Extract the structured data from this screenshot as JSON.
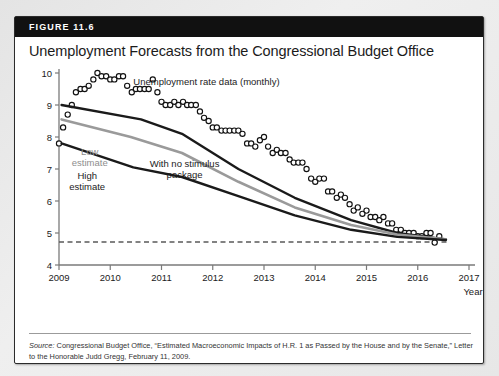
{
  "figure": {
    "number_label": "FIGURE 11.6",
    "title": "Unemployment Forecasts from the Congressional Budget Office",
    "source_label": "Source:",
    "source_text": " Congressional Budget Office, “Estimated Macroeconomic Impacts of H.R. 1 as Passed by the House and by the Senate,” Letter to the Honorable Judd Gregg, February 11, 2009."
  },
  "colors": {
    "header_bar": "#111111",
    "card_border": "#2b2b2b",
    "axis": "#7a7a7a",
    "no_stimulus_line": "#1a1a1a",
    "low_estimate_line": "#9a9a9a",
    "high_estimate_line": "#1a1a1a",
    "marker_stroke": "#111111",
    "dashed_line": "#5a5a5a",
    "text": "#1b1b1b"
  },
  "chart_data": {
    "type": "line",
    "title": "Unemployment Forecasts from the Congressional Budget Office",
    "xlabel": "Year",
    "ylabel": "Percent",
    "xlim": [
      2009,
      2017
    ],
    "ylim": [
      4,
      10
    ],
    "xticks": [
      "2009",
      "2010",
      "2011",
      "2012",
      "2013",
      "2014",
      "2015",
      "2016",
      "2017"
    ],
    "yticks": [
      "4",
      "5",
      "6",
      "7",
      "8",
      "9",
      "10"
    ],
    "grid": false,
    "legend": "inline-annotations",
    "annotations": [
      {
        "name": "unemployment-rate-data",
        "text": "Unemployment rate data (monthly)",
        "x": 2010.45,
        "y": 9.62
      },
      {
        "name": "low-estimate",
        "text": "Low\nestimate",
        "x": 2009.6,
        "y": 7.45
      },
      {
        "name": "high-estimate",
        "text": "High\nestimate",
        "x": 2009.55,
        "y": 6.7
      },
      {
        "name": "with-no-stimulus-package",
        "text": "With no stimulus\npackage",
        "x": 2011.45,
        "y": 7.05
      }
    ],
    "reference_line": {
      "name": "natural-rate-dashed",
      "y": 4.72,
      "x_start": 2009.0,
      "x_end": 2016.6,
      "style": "dashed"
    },
    "series": [
      {
        "name": "Unemployment rate data (monthly)",
        "type": "scatter",
        "marker": "open-circle",
        "x": [
          2009.0,
          2009.08,
          2009.17,
          2009.25,
          2009.33,
          2009.42,
          2009.5,
          2009.58,
          2009.67,
          2009.75,
          2009.83,
          2009.92,
          2010.0,
          2010.08,
          2010.17,
          2010.25,
          2010.33,
          2010.42,
          2010.5,
          2010.58,
          2010.67,
          2010.75,
          2010.83,
          2010.92,
          2011.0,
          2011.08,
          2011.17,
          2011.25,
          2011.33,
          2011.42,
          2011.5,
          2011.58,
          2011.67,
          2011.75,
          2011.83,
          2011.92,
          2012.0,
          2012.08,
          2012.17,
          2012.25,
          2012.33,
          2012.42,
          2012.5,
          2012.58,
          2012.67,
          2012.75,
          2012.83,
          2012.92,
          2013.0,
          2013.08,
          2013.17,
          2013.25,
          2013.33,
          2013.42,
          2013.5,
          2013.58,
          2013.67,
          2013.75,
          2013.83,
          2013.92,
          2014.0,
          2014.08,
          2014.17,
          2014.25,
          2014.33,
          2014.42,
          2014.5,
          2014.58,
          2014.67,
          2014.75,
          2014.83,
          2014.92,
          2015.0,
          2015.08,
          2015.17,
          2015.25,
          2015.33,
          2015.42,
          2015.5,
          2015.58,
          2015.67,
          2015.75,
          2015.83,
          2015.92,
          2016.0,
          2016.08,
          2016.17,
          2016.25,
          2016.33,
          2016.42
        ],
        "y": [
          7.8,
          8.3,
          8.7,
          9.0,
          9.4,
          9.5,
          9.5,
          9.6,
          9.8,
          10.0,
          9.9,
          9.9,
          9.8,
          9.8,
          9.9,
          9.9,
          9.6,
          9.4,
          9.5,
          9.5,
          9.5,
          9.5,
          9.8,
          9.4,
          9.1,
          9.0,
          9.0,
          9.1,
          9.0,
          9.1,
          9.0,
          9.0,
          9.0,
          8.8,
          8.6,
          8.5,
          8.3,
          8.3,
          8.2,
          8.2,
          8.2,
          8.2,
          8.2,
          8.1,
          7.8,
          7.8,
          7.7,
          7.9,
          8.0,
          7.7,
          7.5,
          7.6,
          7.5,
          7.5,
          7.3,
          7.2,
          7.2,
          7.2,
          7.0,
          6.7,
          6.6,
          6.7,
          6.7,
          6.3,
          6.3,
          6.1,
          6.2,
          6.1,
          5.9,
          5.7,
          5.8,
          5.6,
          5.7,
          5.5,
          5.5,
          5.4,
          5.5,
          5.3,
          5.3,
          5.1,
          5.1,
          5.0,
          5.0,
          5.0,
          4.9,
          4.9,
          5.0,
          5.0,
          4.7,
          4.9
        ]
      },
      {
        "name": "With no stimulus package",
        "type": "line",
        "color": "#1a1a1a",
        "width": 2.4,
        "x": [
          2009.05,
          2010.6,
          2011.4,
          2012.5,
          2013.6,
          2014.7,
          2015.6,
          2016.55
        ],
        "y": [
          9.0,
          8.55,
          8.1,
          7.0,
          6.1,
          5.4,
          5.0,
          4.8
        ]
      },
      {
        "name": "Low estimate",
        "type": "line",
        "color": "#9a9a9a",
        "width": 2.6,
        "x": [
          2009.05,
          2010.4,
          2011.4,
          2012.5,
          2013.6,
          2014.7,
          2015.6,
          2016.55
        ],
        "y": [
          8.55,
          8.0,
          7.5,
          6.6,
          5.8,
          5.25,
          4.95,
          4.8
        ]
      },
      {
        "name": "High estimate",
        "type": "line",
        "color": "#1a1a1a",
        "width": 2.4,
        "x": [
          2009.05,
          2010.45,
          2011.4,
          2012.5,
          2013.6,
          2014.7,
          2015.6,
          2016.55
        ],
        "y": [
          7.8,
          7.05,
          6.75,
          6.15,
          5.55,
          5.1,
          4.88,
          4.78
        ]
      }
    ]
  }
}
